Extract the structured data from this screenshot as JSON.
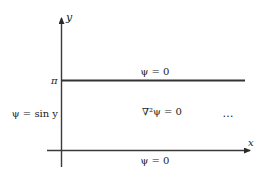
{
  "diagram": {
    "axes": {
      "x_label": "x",
      "y_label": "y",
      "y_tick_label": "π"
    },
    "boundary_conditions": {
      "top": "ψ = 0",
      "bottom": "ψ = 0",
      "left": "ψ = sin y"
    },
    "interior_equation": "∇²ψ = 0",
    "continuation": "…",
    "colors": {
      "line": "#3a3a3a",
      "text": "#222222"
    }
  }
}
